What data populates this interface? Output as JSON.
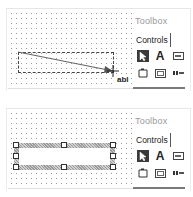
{
  "panels": [
    {
      "id": "drawing-textbox",
      "toolbox": {
        "title": "Toolbox",
        "tab": "Controls",
        "tools": [
          {
            "name": "pointer",
            "glyph": "",
            "selected": true
          },
          {
            "name": "label",
            "glyph": "A",
            "selected": false
          },
          {
            "name": "textbox",
            "glyph": "ab|",
            "selected": false
          },
          {
            "name": "frame",
            "glyph": "",
            "selected": false
          },
          {
            "name": "button",
            "glyph": "xx",
            "selected": false
          },
          {
            "name": "more",
            "glyph": "≡▸",
            "selected": false
          }
        ]
      },
      "cursor_label": "abl"
    },
    {
      "id": "textbox-created",
      "toolbox": {
        "title": "Toolbox",
        "tab": "Controls",
        "tools": [
          {
            "name": "pointer",
            "glyph": "",
            "selected": true
          },
          {
            "name": "label",
            "glyph": "A",
            "selected": false
          },
          {
            "name": "textbox",
            "glyph": "ab|",
            "selected": false
          },
          {
            "name": "frame",
            "glyph": "",
            "selected": false
          },
          {
            "name": "button",
            "glyph": "xx",
            "selected": false
          },
          {
            "name": "more",
            "glyph": "≡▸",
            "selected": false
          }
        ]
      }
    }
  ],
  "colors": {
    "grid_dot": "#9a9a9a",
    "selected_tool_bg": "#3a3a3a",
    "title_gray": "#9a9a9a"
  }
}
